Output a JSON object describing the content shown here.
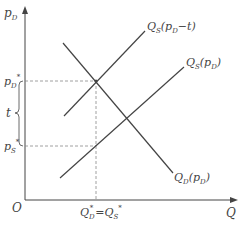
{
  "diagram": {
    "type": "supply-demand-tax",
    "axes": {
      "y_label": "p",
      "y_label_sub": "D",
      "x_label": "Q",
      "origin": "O"
    },
    "curves": {
      "supply_with_tax": {
        "label": "Q",
        "sub": "S",
        "arg": "(p",
        "arg_sub": "D",
        "arg_tail": "−t)"
      },
      "supply": {
        "label": "Q",
        "sub": "S",
        "arg": "(p",
        "arg_sub": "D",
        "arg_tail": ")"
      },
      "demand": {
        "label": "Q",
        "sub": "D",
        "arg": "(p",
        "arg_sub": "D",
        "arg_tail": ")"
      }
    },
    "price_labels": {
      "pd_star": {
        "base": "p",
        "sub": "D",
        "sup": "*"
      },
      "ps_star": {
        "base": "p",
        "sub": "S",
        "sup": "*"
      },
      "tax": "t"
    },
    "quantity_label": {
      "left": "Q",
      "left_sub": "D",
      "left_sup": "*",
      "eq": "=",
      "right": "Q",
      "right_sub": "S",
      "right_sup": "*"
    },
    "colors": {
      "line": "#444444",
      "dashed": "#888888",
      "text": "#444444"
    }
  }
}
